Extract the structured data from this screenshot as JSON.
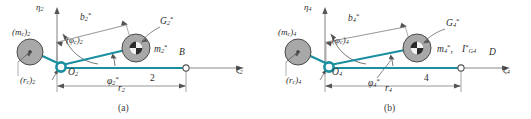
{
  "figure": {
    "type": "mechanism-balancing-diagram",
    "colors": {
      "link_teal": "#1a8fa0",
      "disk_gray": "#a8a8a8",
      "disk_edge": "#555555",
      "dimension_gray": "#8a8a8a",
      "text": "#2b2b2b",
      "background": "#ffffff"
    },
    "panels": [
      {
        "id": "a",
        "caption": "(a)",
        "axes": {
          "vertical_label": "η",
          "vertical_sub": "2",
          "horizontal_label": "ξ",
          "horizontal_sub": "2"
        },
        "pivot": {
          "label": "O",
          "sub": "2"
        },
        "end_point": {
          "label": "B"
        },
        "link_number": "2",
        "counterweight": {
          "mass_label": "(m",
          "mass_sub": "c",
          "mass_close": ")",
          "mass_index": "2",
          "radius_label": "(r",
          "radius_sub": "c",
          "radius_close": ")",
          "radius_index": "2"
        },
        "center_of_mass": {
          "label": "G",
          "sub": "2",
          "star": "*"
        },
        "mass": {
          "label": "m",
          "sub": "2",
          "star": "*"
        },
        "inertia": null,
        "dimension_b": {
          "label": "b",
          "sub": "2",
          "star": "*"
        },
        "dimension_r": {
          "label": "r",
          "sub": "2"
        },
        "angle_phi_c": {
          "label": "(φ",
          "sub": "c",
          "close": ")",
          "index": "2"
        },
        "angle_phi_star": {
          "label": "φ",
          "sub": "2",
          "star": "*"
        }
      },
      {
        "id": "b",
        "caption": "(b)",
        "axes": {
          "vertical_label": "η",
          "vertical_sub": "4",
          "horizontal_label": "ξ",
          "horizontal_sub": "4"
        },
        "pivot": {
          "label": "O",
          "sub": "4"
        },
        "end_point": {
          "label": "D"
        },
        "link_number": "4",
        "counterweight": {
          "mass_label": "(m",
          "mass_sub": "c",
          "mass_close": ")",
          "mass_index": "4",
          "radius_label": "(r",
          "radius_sub": "c",
          "radius_close": ")",
          "radius_index": "4"
        },
        "center_of_mass": {
          "label": "G",
          "sub": "4",
          "star": "*"
        },
        "mass": {
          "label": "m",
          "sub": "4",
          "star": "*"
        },
        "inertia": {
          "label": "I",
          "sub": "G4",
          "star": "*"
        },
        "dimension_b": {
          "label": "b",
          "sub": "4",
          "star": "*"
        },
        "dimension_r": {
          "label": "r",
          "sub": "4"
        },
        "angle_phi_c": {
          "label": "(φ",
          "sub": "c",
          "close": ")",
          "index": "4"
        },
        "angle_phi_star": {
          "label": "φ",
          "sub": "4",
          "star": "*"
        }
      }
    ]
  }
}
